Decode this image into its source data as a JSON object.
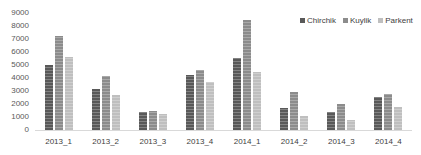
{
  "chart_data": {
    "type": "bar",
    "title": "",
    "xlabel": "",
    "ylabel": "",
    "ylim": [
      0,
      9000
    ],
    "yticks": [
      0,
      1000,
      2000,
      3000,
      4000,
      5000,
      6000,
      7000,
      8000,
      9000
    ],
    "grid": false,
    "legend_position": "top-right",
    "categories": [
      "2013_1",
      "2013_2",
      "2013_3",
      "2013_4",
      "2014_1",
      "2014_2",
      "2014_3",
      "2014_4"
    ],
    "series": [
      {
        "name": "Chirchik",
        "color": "#595959",
        "values": [
          5000,
          3150,
          1400,
          4250,
          5550,
          1700,
          1400,
          2550
        ]
      },
      {
        "name": "Kuylik",
        "color": "#8c8c8c",
        "values": [
          7200,
          4150,
          1450,
          4600,
          8450,
          2950,
          2000,
          2800
        ]
      },
      {
        "name": "Parkent",
        "color": "#bfbfbf",
        "values": [
          5600,
          2700,
          1200,
          3700,
          4450,
          1050,
          800,
          1800
        ]
      }
    ]
  }
}
